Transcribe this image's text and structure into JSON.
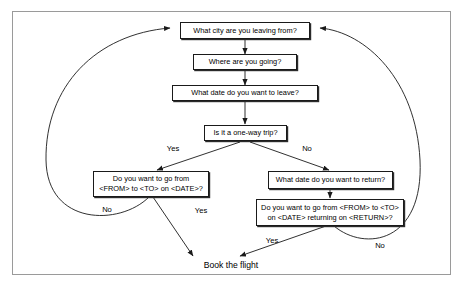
{
  "diagram": {
    "background_color": "#ffffff",
    "border_color": "#9a9a9a",
    "node_border_color": "#1a1a1a",
    "line_color": "#1a1a1a"
  },
  "nodes": [
    {
      "id": "city-from",
      "label": "What city are you leaving from?"
    },
    {
      "id": "destination",
      "label": "Where are you going?"
    },
    {
      "id": "depart-date",
      "label": "What date do you want to leave?"
    },
    {
      "id": "one-way",
      "label": "Is it a one-way trip?"
    },
    {
      "id": "confirm-oneway",
      "label": "Do you want to go from\n<FROM> to <TO> on <DATE>?"
    },
    {
      "id": "return-date",
      "label": "What date do you want to return?"
    },
    {
      "id": "confirm-return",
      "label": "Do you want to go from <FROM> to <TO>\non <DATE> returning on <RETURN>?"
    }
  ],
  "terminal": {
    "id": "book-flight",
    "label": "Book the flight"
  },
  "edge_labels": [
    {
      "id": "oneway-yes",
      "label": "Yes"
    },
    {
      "id": "oneway-no",
      "label": "No"
    },
    {
      "id": "confirm-oneway-no",
      "label": "No"
    },
    {
      "id": "confirm-oneway-yes",
      "label": "Yes"
    },
    {
      "id": "confirm-return-yes",
      "label": "Yes"
    },
    {
      "id": "confirm-return-no",
      "label": "No"
    }
  ]
}
